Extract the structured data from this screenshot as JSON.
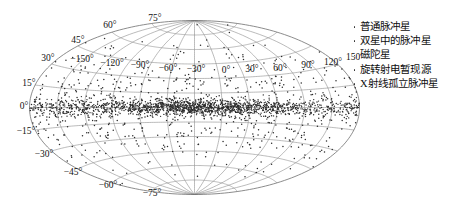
{
  "figure": {
    "type": "sky-map",
    "projection": "aitoff",
    "background_color": "#ffffff",
    "grid_color": "#8d8d8d",
    "point_color": "#2b2b2b"
  },
  "legend": {
    "position": "top-right",
    "marker": "dot",
    "items": [
      {
        "label": "普通脉冲星",
        "marker": "dot",
        "color": "#2b2b2b"
      },
      {
        "label": "双星中的脉冲星",
        "marker": "dot",
        "color": "#2b2b2b"
      },
      {
        "label": "磁陀星",
        "marker": "dot",
        "color": "#2b2b2b"
      },
      {
        "label": "旋转射电暂现源",
        "marker": "dot",
        "color": "#2b2b2b"
      },
      {
        "label": "X射线孤立脉冲星",
        "marker": "dot",
        "color": "#2b2b2b"
      }
    ]
  },
  "chart_data": {
    "type": "scatter",
    "projection": "aitoff",
    "title": "",
    "xlabel": "",
    "ylabel": "",
    "xlim": [
      -180,
      180
    ],
    "ylim": [
      -90,
      90
    ],
    "grid": true,
    "legend_position": "right",
    "latitude_ticks": [
      {
        "value": 75,
        "label": "75°",
        "x": 155,
        "y": 21
      },
      {
        "value": 60,
        "label": "60°",
        "x": 110,
        "y": 28
      },
      {
        "value": 45,
        "label": "45°",
        "x": 78,
        "y": 43
      },
      {
        "value": 30,
        "label": "30°",
        "x": 48,
        "y": 61
      },
      {
        "value": 15,
        "label": "15°",
        "x": 29,
        "y": 86
      },
      {
        "value": 0,
        "label": "0°",
        "x": 24,
        "y": 109
      },
      {
        "value": -15,
        "label": "−15°",
        "x": 26,
        "y": 134
      },
      {
        "value": -30,
        "label": "−30°",
        "x": 44,
        "y": 157
      },
      {
        "value": -45,
        "label": "−45°",
        "x": 73,
        "y": 175
      },
      {
        "value": -60,
        "label": "−60°",
        "x": 108,
        "y": 188
      },
      {
        "value": -75,
        "label": "−75°",
        "x": 152,
        "y": 196
      }
    ],
    "longitude_ticks": [
      {
        "value": -150,
        "label": "−150°",
        "x": 82,
        "y": 62
      },
      {
        "value": -120,
        "label": "−120°",
        "x": 112,
        "y": 66
      },
      {
        "value": -90,
        "label": "−90°",
        "x": 140,
        "y": 68
      },
      {
        "value": -60,
        "label": "−60°",
        "x": 168,
        "y": 71
      },
      {
        "value": -30,
        "label": "−30°",
        "x": 196,
        "y": 72
      },
      {
        "value": 0,
        "label": "0°",
        "x": 226,
        "y": 73
      },
      {
        "value": 30,
        "label": "30°",
        "x": 252,
        "y": 72
      },
      {
        "value": 60,
        "label": "60°",
        "x": 280,
        "y": 71
      },
      {
        "value": 90,
        "label": "90°",
        "x": 308,
        "y": 68
      },
      {
        "value": 120,
        "label": "120°",
        "x": 333,
        "y": 65
      },
      {
        "value": 150,
        "label": "150°",
        "x": 355,
        "y": 60
      }
    ],
    "graticule": {
      "latitude_lines": [
        -75,
        -60,
        -45,
        -30,
        -15,
        0,
        15,
        30,
        45,
        60,
        75
      ],
      "longitude_lines": [
        -150,
        -120,
        -90,
        -60,
        -30,
        0,
        30,
        60,
        90,
        120,
        150
      ],
      "boundary": "ellipse"
    },
    "series": [
      {
        "name": "普通脉冲星",
        "marker": "dot",
        "color": "#2b2b2b",
        "count": 2300,
        "distribution": "galactic-plane-concentrated",
        "latitude_scale_deg": 4.0,
        "halo_fraction": 0.3,
        "halo_latitude_scale_deg": 26.0
      }
    ],
    "annotations": []
  }
}
